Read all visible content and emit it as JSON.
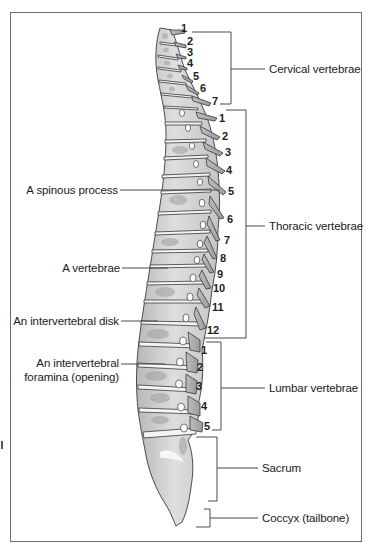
{
  "figure": {
    "frame_color": "#6e6e6e",
    "bone_fill": "#d9d9d9",
    "bone_shade": "#a9a9a9",
    "bone_outline": "#3a3a3a",
    "disk_fill": "#f4f4f4"
  },
  "regions": [
    {
      "id": "cervical",
      "label": "Cervical vertebrae",
      "count": 7,
      "numbers": [
        "1",
        "2",
        "3",
        "4",
        "5",
        "6",
        "7"
      ],
      "bracket": {
        "x": 231,
        "y1": 32,
        "y2": 104,
        "tick_left": 220,
        "label_line_to": 265,
        "label_y": 69
      }
    },
    {
      "id": "thoracic",
      "label": "Thoracic vertebrae",
      "count": 12,
      "numbers": [
        "1",
        "2",
        "3",
        "4",
        "5",
        "6",
        "7",
        "8",
        "9",
        "10",
        "11",
        "12"
      ],
      "bracket": {
        "x": 246,
        "y1": 110,
        "y2": 338,
        "tick_left": 226,
        "label_line_to": 265,
        "label_y": 226
      }
    },
    {
      "id": "lumbar",
      "label": "Lumbar vertebrae",
      "count": 5,
      "numbers": [
        "1",
        "2",
        "3",
        "4",
        "5"
      ],
      "bracket": {
        "x": 221,
        "y1": 342,
        "y2": 430,
        "tick_left": 206,
        "label_line_to": 265,
        "label_y": 388
      }
    },
    {
      "id": "sacrum",
      "label": "Sacrum",
      "bracket": {
        "x": 217,
        "y1": 437,
        "y2": 501,
        "tick_left": 196,
        "label_line_to": 258,
        "label_y": 468
      }
    },
    {
      "id": "coccyx",
      "label": "Coccyx (tailbone)",
      "bracket": {
        "x": 210,
        "y1": 509,
        "y2": 527,
        "tick_left": 196,
        "label_line_to": 258,
        "label_y": 518
      }
    }
  ],
  "callouts": [
    {
      "id": "spinous-process",
      "label": "A spinous process",
      "line_y": 190,
      "line_x1": 120,
      "line_x2": 220
    },
    {
      "id": "vertebrae",
      "label": "A vertebrae",
      "line_y": 268,
      "line_x1": 122,
      "line_x2": 168
    },
    {
      "id": "intervertebral-disk",
      "label": "An intervertebral disk",
      "line_y": 321,
      "line_x1": 121,
      "line_x2": 158
    },
    {
      "id": "intervertebral-foramina",
      "label_line1": "An intervertebral",
      "label_line2": "foramina (opening)",
      "line_y": 364,
      "line_x1": 121,
      "line_x2": 165
    }
  ],
  "vertebra_numbers": {
    "cervical": [
      {
        "n": "1",
        "x": 181,
        "y": 28
      },
      {
        "n": "2",
        "x": 187,
        "y": 41
      },
      {
        "n": "3",
        "x": 187,
        "y": 52
      },
      {
        "n": "4",
        "x": 187,
        "y": 63
      },
      {
        "n": "5",
        "x": 193,
        "y": 76
      },
      {
        "n": "6",
        "x": 200,
        "y": 88
      },
      {
        "n": "7",
        "x": 212,
        "y": 101
      }
    ],
    "thoracic": [
      {
        "n": "1",
        "x": 219,
        "y": 114
      },
      {
        "n": "2",
        "x": 222,
        "y": 133
      },
      {
        "n": "3",
        "x": 225,
        "y": 149
      },
      {
        "n": "4",
        "x": 226,
        "y": 167
      },
      {
        "n": "5",
        "x": 228,
        "y": 188
      },
      {
        "n": "6",
        "x": 227,
        "y": 216
      },
      {
        "n": "7",
        "x": 224,
        "y": 237
      },
      {
        "n": "8",
        "x": 220,
        "y": 255
      },
      {
        "n": "9",
        "x": 217,
        "y": 270
      },
      {
        "n": "10",
        "x": 213,
        "y": 284
      },
      {
        "n": "11",
        "x": 212,
        "y": 303
      },
      {
        "n": "12",
        "x": 207,
        "y": 326
      }
    ],
    "lumbar": [
      {
        "n": "1",
        "x": 201,
        "y": 344
      },
      {
        "n": "2",
        "x": 197,
        "y": 362
      },
      {
        "n": "3",
        "x": 196,
        "y": 381
      },
      {
        "n": "4",
        "x": 201,
        "y": 401
      },
      {
        "n": "5",
        "x": 204,
        "y": 422
      }
    ]
  }
}
